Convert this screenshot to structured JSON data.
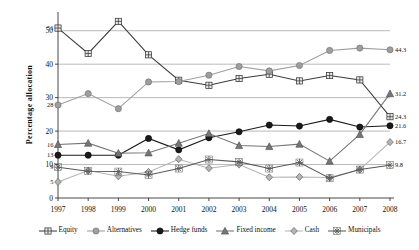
{
  "chart_data": {
    "type": "line",
    "title": "",
    "xlabel": "",
    "ylabel": "Percentage  allocation",
    "x": [
      "1997",
      "1998",
      "1999",
      "2000",
      "2001",
      "2002",
      "2003",
      "2004",
      "2005",
      "2006",
      "2007",
      "2008"
    ],
    "ylim": [
      0,
      55
    ],
    "yticks": [
      "0",
      "10",
      "20",
      "30",
      "40",
      "50"
    ],
    "grid": true,
    "legend_position": "bottom",
    "series": [
      {
        "name": "Equity",
        "color": "#3c3c3c",
        "marker": "plus-square",
        "values": [
          50.8,
          43.2,
          52.8,
          42.8,
          35.2,
          33.7,
          35.7,
          37.0,
          35.0,
          36.6,
          35.3,
          24.3
        ],
        "start_label": "51",
        "end_label": "24.3"
      },
      {
        "name": "Alternatives",
        "color": "#9e9e9e",
        "marker": "circle",
        "values": [
          27.8,
          31.2,
          26.7,
          34.7,
          34.8,
          36.7,
          39.3,
          38.0,
          39.6,
          44.1,
          44.8,
          44.3
        ],
        "start_label": "28",
        "end_label": "44.3"
      },
      {
        "name": "Hedge funds",
        "color": "#1a1a1a",
        "marker": "filled-circle",
        "values": [
          12.8,
          12.8,
          12.8,
          17.8,
          14.4,
          18.0,
          19.8,
          21.8,
          21.5,
          23.5,
          21.2,
          21.6
        ],
        "start_label": "13",
        "end_label": "21.6"
      },
      {
        "name": "Fixed income",
        "color": "#767676",
        "marker": "triangle",
        "values": [
          16.0,
          16.4,
          13.4,
          13.5,
          16.4,
          19.3,
          15.7,
          15.4,
          16.1,
          11.0,
          19.0,
          31.2
        ],
        "start_label": "16",
        "end_label": "31.2"
      },
      {
        "name": "Cash",
        "color": "#b4b4b4",
        "marker": "diamond",
        "values": [
          4.8,
          8.2,
          6.5,
          7.8,
          11.6,
          8.9,
          10.0,
          6.2,
          6.3,
          6.1,
          8.5,
          16.7
        ],
        "start_label": "5",
        "end_label": "16.7"
      },
      {
        "name": "Municipals",
        "color": "#5a5a5a",
        "marker": "asterisk",
        "values": [
          9.2,
          8.0,
          7.9,
          6.9,
          8.8,
          11.5,
          10.8,
          8.8,
          10.6,
          5.9,
          8.5,
          9.8
        ],
        "start_label": "9",
        "end_label": "9.8"
      }
    ]
  }
}
